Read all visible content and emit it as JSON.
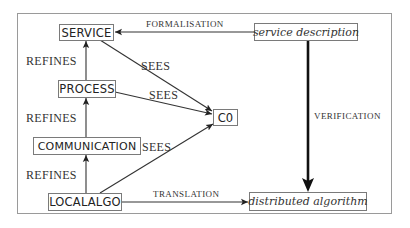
{
  "diagram": {
    "type": "refinement-and-verification-flow",
    "nodes": {
      "service": {
        "label": "SERVICE",
        "style": "sans-box"
      },
      "process": {
        "label": "PROCESS",
        "style": "sans-box"
      },
      "communication": {
        "label": "COMMUNICATION",
        "style": "sans-box"
      },
      "localalgo": {
        "label": "LOCALALGO",
        "style": "sans-box"
      },
      "c0": {
        "label": "C0",
        "style": "sans-box"
      },
      "service_description": {
        "label": "service description",
        "style": "italic-box"
      },
      "distributed_algorithm": {
        "label": "distributed algorithm",
        "style": "italic-box"
      }
    },
    "edges": [
      {
        "from": "service_description",
        "to": "service",
        "label": "FORMALISATION"
      },
      {
        "from": "process",
        "to": "service",
        "label": "REFINES"
      },
      {
        "from": "communication",
        "to": "process",
        "label": "REFINES"
      },
      {
        "from": "localalgo",
        "to": "communication",
        "label": "REFINES"
      },
      {
        "from": "service",
        "to": "c0",
        "label": "SEES"
      },
      {
        "from": "process",
        "to": "c0",
        "label": "SEES"
      },
      {
        "from": "localalgo",
        "to": "c0",
        "label": "SEES"
      },
      {
        "from": "service_description",
        "to": "distributed_algorithm",
        "label": "VERIFICATION"
      },
      {
        "from": "localalgo",
        "to": "distributed_algorithm",
        "label": "TRANSLATION"
      }
    ],
    "labels": {
      "formalisation": "FORMALISATION",
      "refines_1": "REFINES",
      "refines_2": "REFINES",
      "refines_3": "REFINES",
      "sees_1": "SEES",
      "sees_2": "SEES",
      "sees_3": "SEES",
      "verification": "VERIFICATION",
      "translation": "TRANSLATION"
    },
    "colors": {
      "line": "#333333",
      "box_border": "#7a7a7a",
      "frame_border": "#9a9a9a",
      "text": "#222222"
    }
  }
}
